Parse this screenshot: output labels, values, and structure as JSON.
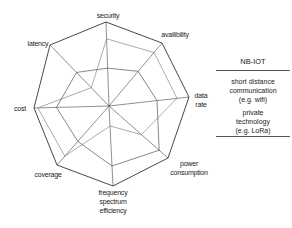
{
  "chart_data": {
    "type": "radar",
    "title": "",
    "axes": [
      "security",
      "availibility",
      "data rate",
      "power consumption",
      "frequency spectrum efficiency",
      "coverage",
      "cost",
      "latency"
    ],
    "range": [
      0,
      1
    ],
    "grid": false,
    "legend_position": "right",
    "series": [
      {
        "name": "NB-IOT",
        "values": [
          1.0,
          1.0,
          1.0,
          1.0,
          1.0,
          1.0,
          1.0,
          1.0
        ],
        "stroke": "#333333"
      },
      {
        "name": "short distance communication (e.g. wifi)",
        "values": [
          0.8,
          0.85,
          0.85,
          0.55,
          0.25,
          0.85,
          0.95,
          0.3
        ],
        "stroke": "#888888"
      },
      {
        "name": "private technology (e.g. LoRa)",
        "values": [
          0.45,
          0.55,
          0.6,
          0.85,
          0.75,
          0.6,
          0.7,
          0.55
        ],
        "stroke": "#555555"
      }
    ]
  },
  "labels": {
    "security": "security",
    "availability": "availibility",
    "data_rate_1": "data",
    "data_rate_2": "rate",
    "power_1": "power",
    "power_2": "consumption",
    "freq_1": "frequency",
    "freq_2": "spectrum",
    "freq_3": "efficiency",
    "coverage": "coverage",
    "cost": "cost",
    "latency": "latency"
  },
  "legend": {
    "title": "NB-IOT",
    "item1_l1": "short distance",
    "item1_l2": "communication",
    "item1_l3": "(e.g. wifi)",
    "item2_l1": "private",
    "item2_l2": "technology",
    "item2_l3": "(e.g. LoRa)"
  }
}
